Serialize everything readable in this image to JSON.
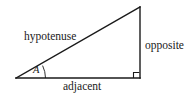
{
  "figure": {
    "background_color": "#ffffff",
    "stroke_color": "#1a1a1a",
    "labels": {
      "hypotenuse": "hypotenuse",
      "opposite": "opposite",
      "adjacent": "adjacent",
      "angle": "A"
    },
    "geometry": {
      "left_vertex": "16,78",
      "right_vertex": "140,78",
      "top_vertex": "140,7",
      "right_angle_marker": "bottom-right",
      "angle_arc": "left vertex"
    }
  }
}
